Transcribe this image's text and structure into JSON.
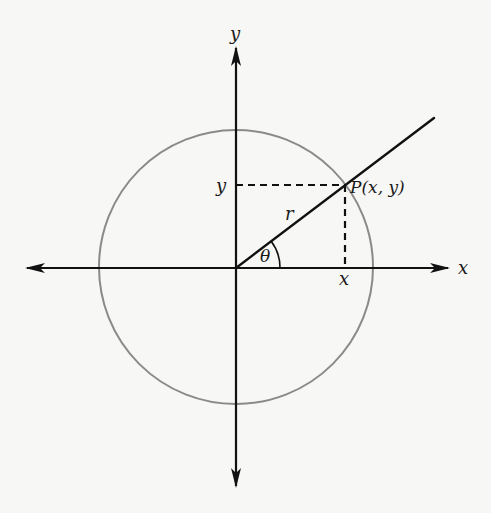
{
  "diagram": {
    "labels": {
      "y_axis": "y",
      "x_axis": "x",
      "y_proj": "y",
      "x_proj": "x",
      "radius": "r",
      "angle": "θ",
      "point": "P(x, y)"
    },
    "colors": {
      "axis": "#111111",
      "circle": "#8a8a8a",
      "background": "#f7f7f5"
    },
    "geometry": {
      "origin": [
        236,
        267
      ],
      "circle_radius": 136,
      "point_P": [
        345,
        185
      ],
      "ray_end": [
        434,
        118
      ]
    }
  }
}
